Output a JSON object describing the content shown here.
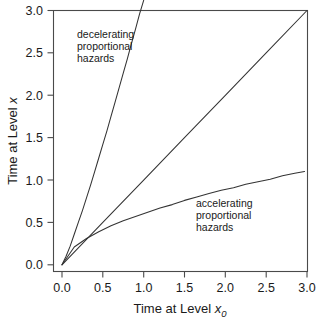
{
  "chart_data": {
    "type": "line",
    "title": "",
    "xlabel": "Time at Level x0",
    "xlabel_base": "Time at Level ",
    "xlabel_var": "x",
    "xlabel_sub": "0",
    "ylabel": "Time at Level x",
    "ylabel_base": "Time at Level ",
    "ylabel_var": "x",
    "xlim": [
      0.0,
      3.15
    ],
    "ylim": [
      0.0,
      3.12
    ],
    "xticks": [
      0.0,
      0.5,
      1.0,
      1.5,
      2.0,
      2.5,
      3.0
    ],
    "xtick_labels": [
      "0.0",
      "0.5",
      "1.0",
      "1.5",
      "2.0",
      "2.5",
      "3.0"
    ],
    "yticks": [
      0.0,
      0.5,
      1.0,
      1.5,
      2.0,
      2.5,
      3.0
    ],
    "ytick_labels": [
      "0.0",
      "0.5",
      "1.0",
      "1.5",
      "2.0",
      "2.5",
      "3.0"
    ],
    "grid": false,
    "legend": "none",
    "frame": "box",
    "line_color": "#333333",
    "axis_color": "#4a4a4a",
    "background": "#ffffff",
    "series": [
      {
        "name": "decelerating proportional hazards",
        "annotation": "decelerating proportional hazards",
        "form": "y = 3.0 * (x/1.0)^1.15",
        "x": [
          0.0,
          0.05,
          0.1,
          0.15,
          0.2,
          0.25,
          0.3,
          0.35,
          0.4,
          0.45,
          0.5,
          0.55,
          0.6,
          0.65,
          0.7,
          0.75,
          0.8,
          0.85,
          0.9,
          0.95,
          1.0
        ],
        "y": [
          0.0,
          0.1,
          0.22,
          0.36,
          0.5,
          0.64,
          0.79,
          0.94,
          1.1,
          1.26,
          1.42,
          1.58,
          1.75,
          1.92,
          2.09,
          2.26,
          2.43,
          2.61,
          2.78,
          2.96,
          3.12
        ]
      },
      {
        "name": "reference identity line",
        "annotation": "",
        "form": "y = x",
        "x": [
          0.0,
          0.5,
          1.0,
          1.5,
          2.0,
          2.5,
          3.0
        ],
        "y": [
          0.0,
          0.5,
          1.0,
          1.5,
          2.0,
          2.5,
          3.0
        ]
      },
      {
        "name": "accelerating proportional hazards",
        "annotation": "accelerating proportional hazards",
        "form": "y = 1.10 * (x/3.0)^0.55",
        "x": [
          0.0,
          0.15,
          0.3,
          0.45,
          0.6,
          0.75,
          0.9,
          1.05,
          1.2,
          1.35,
          1.5,
          1.65,
          1.8,
          1.95,
          2.1,
          2.25,
          2.4,
          2.55,
          2.7,
          2.85,
          2.97
        ],
        "y": [
          0.0,
          0.21,
          0.31,
          0.39,
          0.46,
          0.52,
          0.57,
          0.62,
          0.67,
          0.71,
          0.76,
          0.8,
          0.84,
          0.88,
          0.91,
          0.95,
          0.98,
          1.01,
          1.05,
          1.08,
          1.1
        ]
      }
    ],
    "annotations": [
      {
        "name": "decelerating-annotation",
        "lines": [
          "decelerating",
          "proportional",
          "hazards"
        ],
        "x_px": 77,
        "y_px": 34
      },
      {
        "name": "accelerating-annotation",
        "lines": [
          "accelerating",
          "proportional",
          "hazards"
        ],
        "x_px": 196,
        "y_px": 203
      }
    ]
  }
}
